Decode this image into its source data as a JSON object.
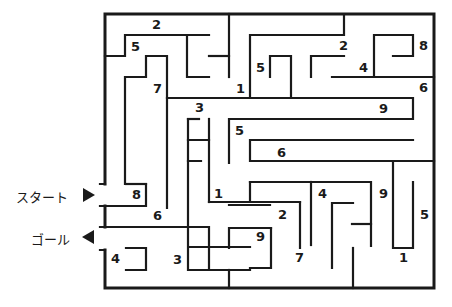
{
  "puzzle": {
    "type": "number-maze",
    "start_label": "スタート",
    "goal_label": "ゴール",
    "wall_color": "#1a1a1a",
    "background": "#ffffff"
  },
  "numbers": [
    {
      "id": "n1",
      "value": "2",
      "x": 156,
      "y": 29
    },
    {
      "id": "n2",
      "value": "5",
      "x": 135,
      "y": 51
    },
    {
      "id": "n3",
      "value": "7",
      "x": 157,
      "y": 93
    },
    {
      "id": "n4",
      "value": "1",
      "x": 240,
      "y": 93
    },
    {
      "id": "n5",
      "value": "5",
      "x": 260,
      "y": 72
    },
    {
      "id": "n6",
      "value": "3",
      "x": 199,
      "y": 112
    },
    {
      "id": "n7",
      "value": "2",
      "x": 343,
      "y": 50
    },
    {
      "id": "n8",
      "value": "4",
      "x": 363,
      "y": 72
    },
    {
      "id": "n9",
      "value": "8",
      "x": 423,
      "y": 50
    },
    {
      "id": "n10",
      "value": "6",
      "x": 423,
      "y": 92
    },
    {
      "id": "n11",
      "value": "9",
      "x": 383,
      "y": 113
    },
    {
      "id": "n12",
      "value": "5",
      "x": 239,
      "y": 135
    },
    {
      "id": "n13",
      "value": "6",
      "x": 281,
      "y": 157
    },
    {
      "id": "n14",
      "value": "8",
      "x": 136,
      "y": 199
    },
    {
      "id": "n15",
      "value": "1",
      "x": 218,
      "y": 198
    },
    {
      "id": "n16",
      "value": "4",
      "x": 322,
      "y": 198
    },
    {
      "id": "n17",
      "value": "9",
      "x": 383,
      "y": 198
    },
    {
      "id": "n18",
      "value": "5",
      "x": 424,
      "y": 219
    },
    {
      "id": "n19",
      "value": "6",
      "x": 157,
      "y": 220
    },
    {
      "id": "n20",
      "value": "2",
      "x": 282,
      "y": 219
    },
    {
      "id": "n21",
      "value": "9",
      "x": 260,
      "y": 241
    },
    {
      "id": "n22",
      "value": "4",
      "x": 115,
      "y": 263
    },
    {
      "id": "n23",
      "value": "3",
      "x": 177,
      "y": 264
    },
    {
      "id": "n24",
      "value": "7",
      "x": 299,
      "y": 262
    },
    {
      "id": "n25",
      "value": "1",
      "x": 403,
      "y": 262
    }
  ]
}
